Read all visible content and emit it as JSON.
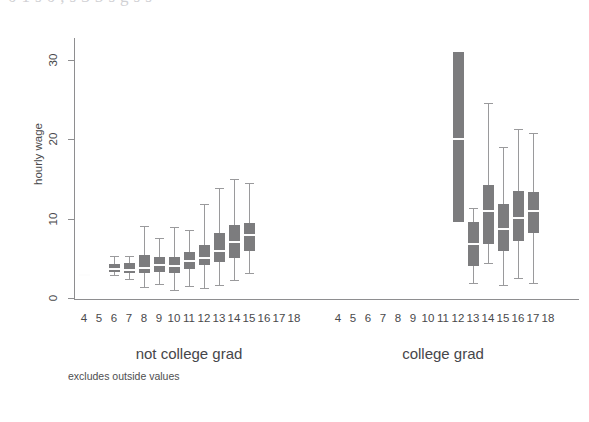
{
  "figure": {
    "y_axis_title": "hourly wage",
    "footnote": "excludes outside values",
    "page_bleed_text": "0 1 s 0 , s 3 5 s g s s",
    "colors": {
      "box_fill": "#7c7c7e",
      "median": "#fdfdfd",
      "whisker": "#9a9a9c",
      "axis": "#8e8e90",
      "text": "#49494b",
      "background": "#ffffff"
    }
  },
  "panels": [
    {
      "id": "not-college-grad",
      "label": "not college grad"
    },
    {
      "id": "college-grad",
      "label": "college grad"
    }
  ],
  "chart_data": {
    "type": "box",
    "title": "",
    "subtitle": "",
    "xlabel": "",
    "ylabel": "hourly wage",
    "footnote": "excludes outside values",
    "ylim": [
      0,
      32
    ],
    "yticks": [
      0,
      10,
      20,
      30
    ],
    "ytick_labels": [
      "0",
      "10",
      "20",
      "30"
    ],
    "grid": false,
    "legend": "none",
    "panel_variable": "college grad",
    "x_variable": "years of schooling",
    "categories": [
      "4",
      "5",
      "6",
      "7",
      "8",
      "9",
      "10",
      "11",
      "12",
      "13",
      "14",
      "15",
      "16",
      "17",
      "18"
    ],
    "panels": [
      {
        "name": "not college grad",
        "boxes": [
          {
            "category": "4",
            "present": true,
            "lower_whisker": 2.8,
            "q1": 2.8,
            "median": 2.9,
            "q3": 3.0,
            "upper_whisker": 3.0
          },
          {
            "category": "5",
            "present": false
          },
          {
            "category": "6",
            "present": true,
            "lower_whisker": 2.9,
            "q1": 3.3,
            "median": 3.6,
            "q3": 4.3,
            "upper_whisker": 5.3
          },
          {
            "category": "7",
            "present": true,
            "lower_whisker": 2.4,
            "q1": 3.1,
            "median": 3.5,
            "q3": 4.4,
            "upper_whisker": 5.3
          },
          {
            "category": "8",
            "present": true,
            "lower_whisker": 1.4,
            "q1": 3.1,
            "median": 3.8,
            "q3": 5.4,
            "upper_whisker": 9.0
          },
          {
            "category": "9",
            "present": true,
            "lower_whisker": 1.8,
            "q1": 3.3,
            "median": 4.1,
            "q3": 5.1,
            "upper_whisker": 7.5
          },
          {
            "category": "10",
            "present": true,
            "lower_whisker": 1.0,
            "q1": 3.1,
            "median": 4.0,
            "q3": 5.2,
            "upper_whisker": 8.9
          },
          {
            "category": "11",
            "present": true,
            "lower_whisker": 1.5,
            "q1": 3.7,
            "median": 4.6,
            "q3": 5.8,
            "upper_whisker": 8.5
          },
          {
            "category": "12",
            "present": true,
            "lower_whisker": 1.2,
            "q1": 4.1,
            "median": 5.0,
            "q3": 6.7,
            "upper_whisker": 11.8
          },
          {
            "category": "13",
            "present": true,
            "lower_whisker": 1.6,
            "q1": 4.5,
            "median": 5.9,
            "q3": 8.2,
            "upper_whisker": 13.8
          },
          {
            "category": "14",
            "present": true,
            "lower_whisker": 2.3,
            "q1": 5.0,
            "median": 7.0,
            "q3": 9.2,
            "upper_whisker": 15.0
          },
          {
            "category": "15",
            "present": true,
            "lower_whisker": 3.2,
            "q1": 5.9,
            "median": 7.9,
            "q3": 9.4,
            "upper_whisker": 14.5
          },
          {
            "category": "16",
            "present": false
          },
          {
            "category": "17",
            "present": false
          },
          {
            "category": "18",
            "present": false
          }
        ]
      },
      {
        "name": "college grad",
        "boxes": [
          {
            "category": "4",
            "present": false
          },
          {
            "category": "5",
            "present": false
          },
          {
            "category": "6",
            "present": false
          },
          {
            "category": "7",
            "present": false
          },
          {
            "category": "8",
            "present": false
          },
          {
            "category": "9",
            "present": false
          },
          {
            "category": "10",
            "present": false
          },
          {
            "category": "11",
            "present": false
          },
          {
            "category": "12",
            "present": true,
            "lower_whisker": 9.5,
            "q1": 9.5,
            "median": 20.0,
            "q3": 31.0,
            "upper_whisker": 31.0
          },
          {
            "category": "13",
            "present": true,
            "lower_whisker": 1.9,
            "q1": 4.0,
            "median": 6.8,
            "q3": 9.6,
            "upper_whisker": 11.3
          },
          {
            "category": "14",
            "present": true,
            "lower_whisker": 4.4,
            "q1": 6.8,
            "median": 10.9,
            "q3": 14.2,
            "upper_whisker": 24.5
          },
          {
            "category": "15",
            "present": true,
            "lower_whisker": 1.6,
            "q1": 5.9,
            "median": 8.7,
            "q3": 11.8,
            "upper_whisker": 19.0
          },
          {
            "category": "16",
            "present": true,
            "lower_whisker": 2.5,
            "q1": 7.2,
            "median": 10.1,
            "q3": 13.4,
            "upper_whisker": 21.3
          },
          {
            "category": "17",
            "present": true,
            "lower_whisker": 1.9,
            "q1": 8.2,
            "median": 10.9,
            "q3": 13.3,
            "upper_whisker": 20.8
          },
          {
            "category": "18",
            "present": false
          }
        ]
      }
    ]
  },
  "geometry": {
    "plot_top": 38,
    "plot_bottom": 299,
    "y_zero_px": 298,
    "px_per_unit": 7.95,
    "panel_x_starts": [
      84,
      338
    ],
    "panel_tick_step": 15.0,
    "box_width": 11
  }
}
